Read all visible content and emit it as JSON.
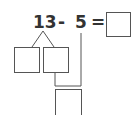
{
  "equation": {
    "minuend": "13",
    "operator": "-",
    "subtrahend": "5",
    "equals": "=",
    "answer": ""
  },
  "decomposition": {
    "left_box": "",
    "right_box": "",
    "bottom_box": ""
  },
  "colors": {
    "text": "#333333",
    "line": "#555555",
    "background": "#ffffff"
  }
}
